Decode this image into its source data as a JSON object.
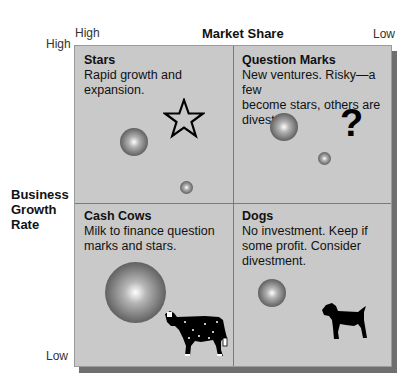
{
  "axes": {
    "x_title": "Market Share",
    "x_high": "High",
    "x_low": "Low",
    "y_title_lines": [
      "Business",
      "Growth",
      "Rate"
    ],
    "y_high": "High",
    "y_low": "Low"
  },
  "quadrants": [
    {
      "title": "Stars",
      "desc_lines": [
        "Rapid growth and",
        "expansion."
      ],
      "icon": "star-icon"
    },
    {
      "title": "Question Marks",
      "desc_lines": [
        "New ventures. Risky—a few",
        "become stars, others are",
        "divested."
      ],
      "icon": "question-mark-icon"
    },
    {
      "title": "Cash Cows",
      "desc_lines": [
        "Milk to finance question",
        "marks and stars."
      ],
      "icon": "cow-icon"
    },
    {
      "title": "Dogs",
      "desc_lines": [
        "No investment. Keep if",
        "some profit. Consider",
        "divestment."
      ],
      "icon": "dog-icon"
    }
  ],
  "glyphs": {
    "question_mark": "?"
  },
  "colors": {
    "panel": "#c9c9c9",
    "divider": "#7a7a7a",
    "shadow": "#6f6f6f"
  }
}
